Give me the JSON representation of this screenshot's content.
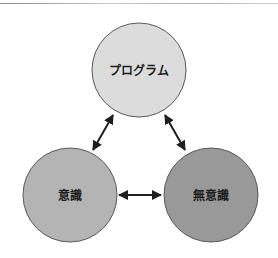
{
  "diagram": {
    "nodes": [
      {
        "id": "program",
        "label": "プログラム",
        "cx": 139,
        "cy": 70,
        "r": 47,
        "fill": "#dcdcdc"
      },
      {
        "id": "conscious",
        "label": "意識",
        "cx": 70,
        "cy": 195,
        "r": 47,
        "fill": "#b4b4b4"
      },
      {
        "id": "unconscious",
        "label": "無意識",
        "cx": 211,
        "cy": 195,
        "r": 47,
        "fill": "#999999"
      }
    ],
    "edges": [
      {
        "from": "program",
        "to": "conscious",
        "type": "bidirectional"
      },
      {
        "from": "program",
        "to": "unconscious",
        "type": "bidirectional"
      },
      {
        "from": "conscious",
        "to": "unconscious",
        "type": "bidirectional"
      }
    ],
    "colors": {
      "stroke": "#5a5a5a",
      "arrow": "#1e1e1e"
    }
  }
}
